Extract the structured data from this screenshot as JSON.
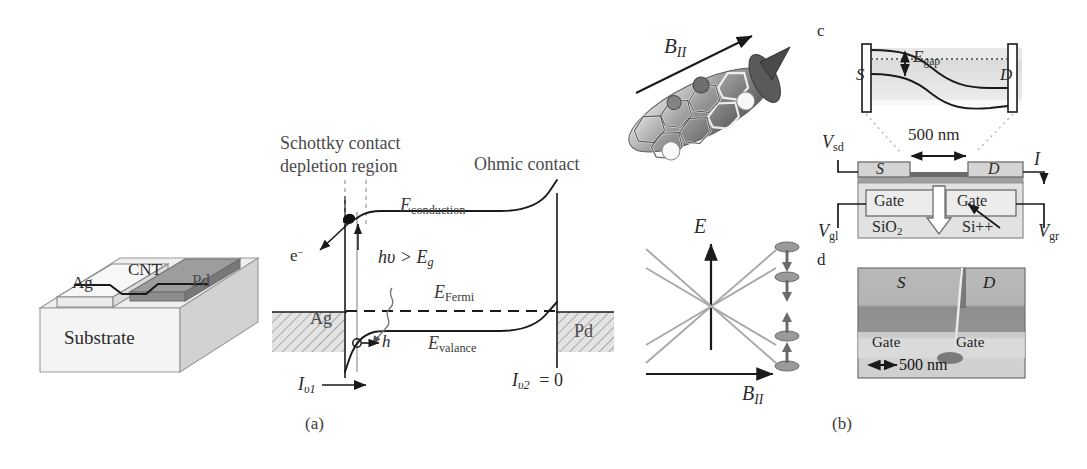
{
  "figure": {
    "panels": [
      {
        "id": "a",
        "caption": "(a)",
        "x": 305,
        "y": 415
      },
      {
        "id": "b",
        "caption": "(b)",
        "x": 832,
        "y": 415
      }
    ],
    "inset_labels": [
      {
        "id": "c",
        "text": "c",
        "x": 817,
        "y": 24
      },
      {
        "id": "d",
        "text": "d",
        "x": 817,
        "y": 253
      }
    ]
  },
  "panel_a": {
    "device3d": {
      "substrate_label": "Substrate",
      "left_electrode_label": "Ag",
      "right_electrode_label": "Pd",
      "nanotube_label": "CNT"
    },
    "band_diagram": {
      "schottky_label_line1": "Schottky contact",
      "schottky_label_line2": "depletion region",
      "ohmic_label": "Ohmic contact",
      "conduction_band": "E",
      "conduction_band_sub": "conduction",
      "fermi_level": "E",
      "fermi_level_sub": "Fermi",
      "valence_band": "E",
      "valence_band_sub": "valance",
      "photon_condition": "hυ > E",
      "photon_condition_sub": "g",
      "electron_label": "e",
      "electron_sup": "−",
      "hole_label": "h",
      "current_left": "I",
      "current_left_sub": "υ1",
      "current_right": "I",
      "current_right_sub": "υ2",
      "current_right_value": "= 0",
      "metal_left": "Ag",
      "metal_right": "Pd"
    }
  },
  "panel_b": {
    "nanotube_image": {
      "field_label": "B",
      "field_label_sub": "II",
      "alt": "atomistic carbon-nanotube rendering with parallel magnetic field arrow"
    },
    "zeeman_plot": {
      "y_axis": "E",
      "x_axis": "B",
      "x_axis_sub": "II",
      "n_lines": 4,
      "spin_icons": [
        "down",
        "down",
        "up",
        "up"
      ]
    },
    "band_bending": {
      "source": "S",
      "drain": "D",
      "gap_label": "E",
      "gap_label_sub": "gap"
    },
    "device_cross_section": {
      "length_label": "500 nm",
      "source": "S",
      "drain": "D",
      "gate_left": "Gate",
      "gate_right": "Gate",
      "oxide": "SiO",
      "oxide_sub": "2",
      "substrate": "Si++",
      "bias_sd": "V",
      "bias_sd_sub": "sd",
      "current": "I",
      "gate_left_bias": "V",
      "gate_left_bias_sub": "gl",
      "gate_right_bias": "V",
      "gate_right_bias_sub": "gr"
    },
    "sem_image": {
      "source": "S",
      "drain": "D",
      "gate_left": "Gate",
      "gate_right": "Gate",
      "scale_bar": "500 nm"
    }
  },
  "colors": {
    "ink": "#2b2b2b",
    "line": "#1a1a1a",
    "gray_fill": "#d9d9d9",
    "light_fill": "#ececec",
    "mid_gray": "#b8b8b8",
    "dark_gray": "#8a8a8a",
    "hatch": "#777777"
  }
}
